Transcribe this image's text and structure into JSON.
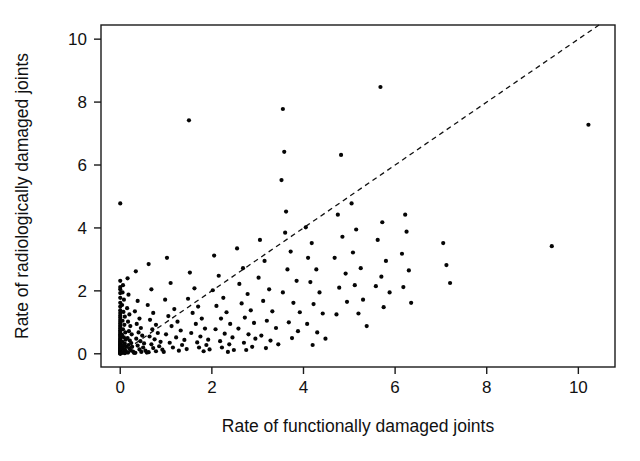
{
  "chart_data": {
    "type": "scatter",
    "title": "",
    "xlabel": "Rate of functionally damaged joints",
    "ylabel": "Rate of radiologically damaged joints",
    "xlim": [
      -0.42,
      10.8
    ],
    "ylim": [
      -0.42,
      10.45
    ],
    "xticks": [
      0,
      2,
      4,
      6,
      8,
      10
    ],
    "yticks": [
      0,
      2,
      4,
      6,
      8,
      10
    ],
    "xtick_labels": [
      "0",
      "2",
      "4",
      "6",
      "8",
      "10"
    ],
    "ytick_labels": [
      "0",
      "2",
      "4",
      "6",
      "8",
      "10"
    ],
    "grid": false,
    "legend": "none",
    "marker": "filled-circle",
    "marker_color": "#050505",
    "marker_size": 2.1,
    "background_color": "#ffffff",
    "frame_color": "#1a1a1a",
    "reference_line": {
      "label": "line of identity",
      "style": "dashed",
      "color": "#111111",
      "x": [
        0,
        10.45
      ],
      "y": [
        0,
        10.45
      ]
    },
    "points": [
      [
        0,
        4.78
      ],
      [
        0,
        2.32
      ],
      [
        0,
        2.12
      ],
      [
        0,
        2.05
      ],
      [
        0,
        1.93
      ],
      [
        0,
        1.78
      ],
      [
        0,
        1.62
      ],
      [
        0,
        1.5
      ],
      [
        0,
        1.38
      ],
      [
        0,
        1.3
      ],
      [
        0,
        1.22
      ],
      [
        0,
        1.15
      ],
      [
        0,
        1.08
      ],
      [
        0,
        1.02
      ],
      [
        0,
        0.96
      ],
      [
        0,
        0.9
      ],
      [
        0,
        0.85
      ],
      [
        0,
        0.8
      ],
      [
        0,
        0.75
      ],
      [
        0,
        0.7
      ],
      [
        0,
        0.66
      ],
      [
        0,
        0.62
      ],
      [
        0,
        0.58
      ],
      [
        0,
        0.54
      ],
      [
        0,
        0.5
      ],
      [
        0,
        0.47
      ],
      [
        0,
        0.44
      ],
      [
        0,
        0.41
      ],
      [
        0,
        0.38
      ],
      [
        0,
        0.35
      ],
      [
        0,
        0.32
      ],
      [
        0,
        0.3
      ],
      [
        0,
        0.27
      ],
      [
        0,
        0.25
      ],
      [
        0,
        0.22
      ],
      [
        0,
        0.2
      ],
      [
        0,
        0.18
      ],
      [
        0,
        0.16
      ],
      [
        0,
        0.14
      ],
      [
        0,
        0.12
      ],
      [
        0,
        0.1
      ],
      [
        0,
        0.08
      ],
      [
        0,
        0.06
      ],
      [
        0,
        0.05
      ],
      [
        0,
        0.04
      ],
      [
        0,
        0.03
      ],
      [
        0,
        0.02
      ],
      [
        0,
        0.01
      ],
      [
        0,
        0
      ],
      [
        0.06,
        2.18
      ],
      [
        0.05,
        1.95
      ],
      [
        0.08,
        1.72
      ],
      [
        0.04,
        1.55
      ],
      [
        0.07,
        1.33
      ],
      [
        0.1,
        1.18
      ],
      [
        0.05,
        1.05
      ],
      [
        0.09,
        0.92
      ],
      [
        0.06,
        0.78
      ],
      [
        0.11,
        0.68
      ],
      [
        0.04,
        0.6
      ],
      [
        0.08,
        0.52
      ],
      [
        0.12,
        0.45
      ],
      [
        0.05,
        0.38
      ],
      [
        0.1,
        0.32
      ],
      [
        0.07,
        0.26
      ],
      [
        0.13,
        0.22
      ],
      [
        0.06,
        0.17
      ],
      [
        0.09,
        0.13
      ],
      [
        0.11,
        0.1
      ],
      [
        0.08,
        0.07
      ],
      [
        0.14,
        0.05
      ],
      [
        0.05,
        0.03
      ],
      [
        0.1,
        0.02
      ],
      [
        0.16,
        2.4
      ],
      [
        0.18,
        1.88
      ],
      [
        0.15,
        1.45
      ],
      [
        0.2,
        1.25
      ],
      [
        0.17,
        1.02
      ],
      [
        0.22,
        0.88
      ],
      [
        0.19,
        0.72
      ],
      [
        0.25,
        0.62
      ],
      [
        0.16,
        0.5
      ],
      [
        0.21,
        0.42
      ],
      [
        0.24,
        0.34
      ],
      [
        0.18,
        0.28
      ],
      [
        0.26,
        0.22
      ],
      [
        0.2,
        0.16
      ],
      [
        0.23,
        0.11
      ],
      [
        0.28,
        0.07
      ],
      [
        0.17,
        0.04
      ],
      [
        0.3,
        0.03
      ],
      [
        0.34,
        2.62
      ],
      [
        0.38,
        1.68
      ],
      [
        0.32,
        1.35
      ],
      [
        0.42,
        1.12
      ],
      [
        0.36,
        0.95
      ],
      [
        0.45,
        0.82
      ],
      [
        0.4,
        0.68
      ],
      [
        0.48,
        0.58
      ],
      [
        0.35,
        0.48
      ],
      [
        0.44,
        0.4
      ],
      [
        0.52,
        0.33
      ],
      [
        0.38,
        0.26
      ],
      [
        0.5,
        0.2
      ],
      [
        0.42,
        0.14
      ],
      [
        0.55,
        0.1
      ],
      [
        0.46,
        0.06
      ],
      [
        0.33,
        0.03
      ],
      [
        0.58,
        0.04
      ],
      [
        0.62,
        2.85
      ],
      [
        0.68,
        2.05
      ],
      [
        0.6,
        1.55
      ],
      [
        0.72,
        1.3
      ],
      [
        0.65,
        1.08
      ],
      [
        0.78,
        0.92
      ],
      [
        0.7,
        0.78
      ],
      [
        0.82,
        0.66
      ],
      [
        0.64,
        0.55
      ],
      [
        0.75,
        0.46
      ],
      [
        0.88,
        0.38
      ],
      [
        0.68,
        0.3
      ],
      [
        0.85,
        0.24
      ],
      [
        0.72,
        0.18
      ],
      [
        0.92,
        0.13
      ],
      [
        0.78,
        0.08
      ],
      [
        0.62,
        0.05
      ],
      [
        0.95,
        0.06
      ],
      [
        1.02,
        3.05
      ],
      [
        1.1,
        2.25
      ],
      [
        0.98,
        1.72
      ],
      [
        1.18,
        1.42
      ],
      [
        1.05,
        1.2
      ],
      [
        1.25,
        1.02
      ],
      [
        1.12,
        0.88
      ],
      [
        1.32,
        0.74
      ],
      [
        1.0,
        0.62
      ],
      [
        1.22,
        0.52
      ],
      [
        1.4,
        0.44
      ],
      [
        1.08,
        0.35
      ],
      [
        1.35,
        0.28
      ],
      [
        1.15,
        0.2
      ],
      [
        1.45,
        0.15
      ],
      [
        1.28,
        0.1
      ],
      [
        1.5,
        7.42
      ],
      [
        1.52,
        2.58
      ],
      [
        1.62,
        2.08
      ],
      [
        1.48,
        1.75
      ],
      [
        1.7,
        1.5
      ],
      [
        1.58,
        1.3
      ],
      [
        1.78,
        1.12
      ],
      [
        1.65,
        0.95
      ],
      [
        1.85,
        0.8
      ],
      [
        1.55,
        0.66
      ],
      [
        1.75,
        0.55
      ],
      [
        1.92,
        0.45
      ],
      [
        1.68,
        0.36
      ],
      [
        1.88,
        0.28
      ],
      [
        1.72,
        0.2
      ],
      [
        1.95,
        0.14
      ],
      [
        1.82,
        0.08
      ],
      [
        2.05,
        3.12
      ],
      [
        2.15,
        2.48
      ],
      [
        2.02,
        2.02
      ],
      [
        2.25,
        1.78
      ],
      [
        2.1,
        1.52
      ],
      [
        2.32,
        1.32
      ],
      [
        2.2,
        1.12
      ],
      [
        2.4,
        0.95
      ],
      [
        2.08,
        0.78
      ],
      [
        2.28,
        0.64
      ],
      [
        2.45,
        0.52
      ],
      [
        2.18,
        0.4
      ],
      [
        2.38,
        0.3
      ],
      [
        2.22,
        0.2
      ],
      [
        2.48,
        0.12
      ],
      [
        2.35,
        0.06
      ],
      [
        2.55,
        3.35
      ],
      [
        2.68,
        2.72
      ],
      [
        2.6,
        2.22
      ],
      [
        2.78,
        1.9
      ],
      [
        2.65,
        1.6
      ],
      [
        2.85,
        1.38
      ],
      [
        2.72,
        1.15
      ],
      [
        2.92,
        0.98
      ],
      [
        2.58,
        0.8
      ],
      [
        2.8,
        0.62
      ],
      [
        2.95,
        0.48
      ],
      [
        2.7,
        0.35
      ],
      [
        2.88,
        0.22
      ],
      [
        2.75,
        0.12
      ],
      [
        3.05,
        3.62
      ],
      [
        3.15,
        2.95
      ],
      [
        3.02,
        2.42
      ],
      [
        3.25,
        2.05
      ],
      [
        3.12,
        1.68
      ],
      [
        3.32,
        1.35
      ],
      [
        3.2,
        1.05
      ],
      [
        3.4,
        0.82
      ],
      [
        3.08,
        0.58
      ],
      [
        3.28,
        0.42
      ],
      [
        3.45,
        0.3
      ],
      [
        3.18,
        0.18
      ],
      [
        3.55,
        7.78
      ],
      [
        3.58,
        6.42
      ],
      [
        3.52,
        5.52
      ],
      [
        3.62,
        4.52
      ],
      [
        3.6,
        3.85
      ],
      [
        3.72,
        3.25
      ],
      [
        3.65,
        2.68
      ],
      [
        3.85,
        2.32
      ],
      [
        3.55,
        1.95
      ],
      [
        3.78,
        1.62
      ],
      [
        3.92,
        1.32
      ],
      [
        3.68,
        1.0
      ],
      [
        3.88,
        0.72
      ],
      [
        3.75,
        0.5
      ],
      [
        4.05,
        4.02
      ],
      [
        4.18,
        3.52
      ],
      [
        4.1,
        3.05
      ],
      [
        4.28,
        2.68
      ],
      [
        4.15,
        2.28
      ],
      [
        4.35,
        1.95
      ],
      [
        4.22,
        1.58
      ],
      [
        4.42,
        1.28
      ],
      [
        4.08,
        0.95
      ],
      [
        4.3,
        0.68
      ],
      [
        4.48,
        0.48
      ],
      [
        4.2,
        0.28
      ],
      [
        4.82,
        6.32
      ],
      [
        4.75,
        4.42
      ],
      [
        4.85,
        3.72
      ],
      [
        4.68,
        3.05
      ],
      [
        4.92,
        2.55
      ],
      [
        4.78,
        2.1
      ],
      [
        4.95,
        1.65
      ],
      [
        4.72,
        1.25
      ],
      [
        5.05,
        4.78
      ],
      [
        5.15,
        3.95
      ],
      [
        5.08,
        3.22
      ],
      [
        5.25,
        2.72
      ],
      [
        5.12,
        2.18
      ],
      [
        5.3,
        1.72
      ],
      [
        5.2,
        1.28
      ],
      [
        5.38,
        0.88
      ],
      [
        5.68,
        8.48
      ],
      [
        5.72,
        4.18
      ],
      [
        5.62,
        3.62
      ],
      [
        5.8,
        2.95
      ],
      [
        5.7,
        2.45
      ],
      [
        5.88,
        1.95
      ],
      [
        5.75,
        1.48
      ],
      [
        6.22,
        4.42
      ],
      [
        6.25,
        3.88
      ],
      [
        6.15,
        3.18
      ],
      [
        6.3,
        2.65
      ],
      [
        6.18,
        2.12
      ],
      [
        6.35,
        1.62
      ],
      [
        5.58,
        2.15
      ],
      [
        7.05,
        3.52
      ],
      [
        7.12,
        2.82
      ],
      [
        7.2,
        2.25
      ],
      [
        9.42,
        3.42
      ],
      [
        10.22,
        7.28
      ]
    ]
  },
  "axes": {
    "x_title": "Rate of functionally damaged joints",
    "y_title": "Rate of radiologically damaged joints"
  }
}
